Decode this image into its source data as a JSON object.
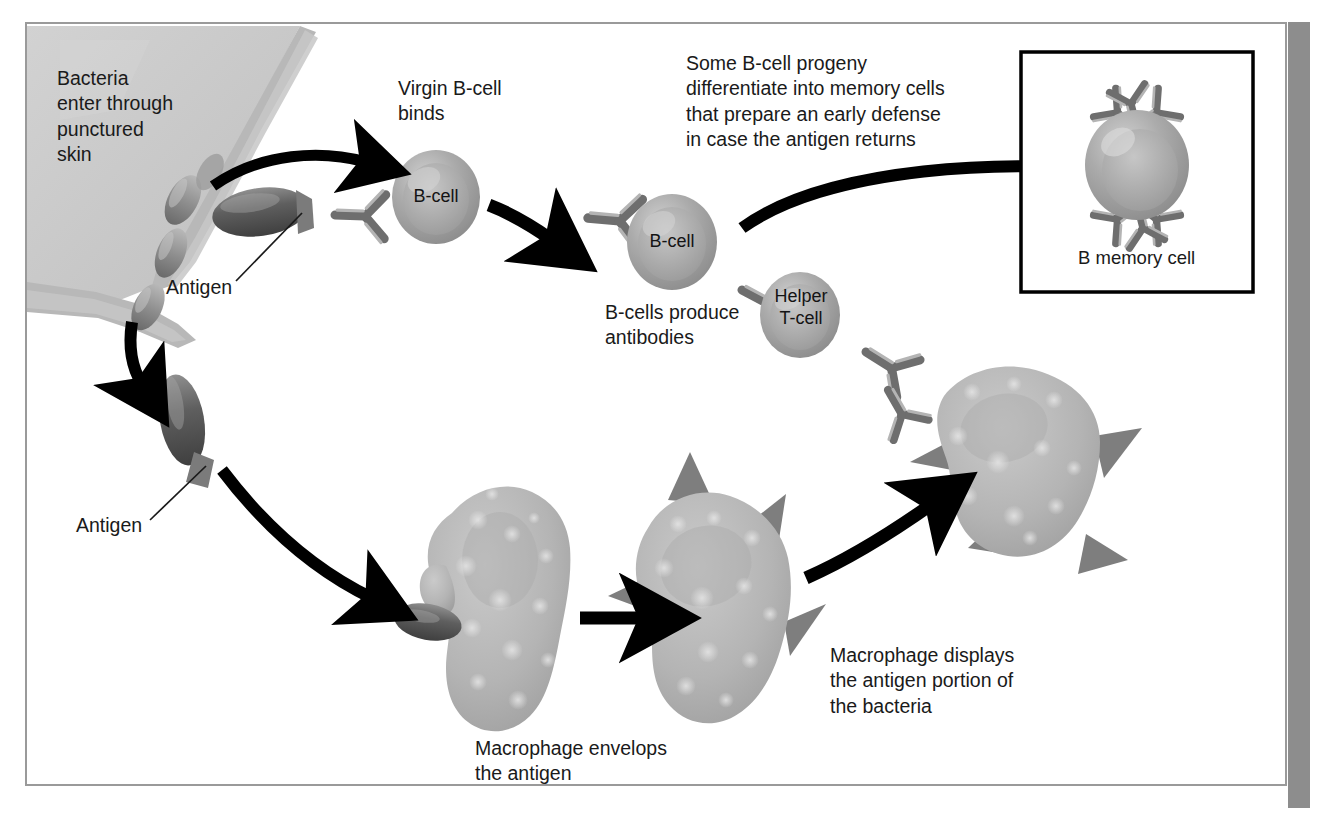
{
  "figure": {
    "domain": "Diagram",
    "title_visible": false,
    "frame": {
      "border_color": "#9a9a9a",
      "background": "#ffffff"
    },
    "page_edge_bar_color": "#8d8d8d"
  },
  "palette": {
    "skin_tissue": "#c9c9c9",
    "skin_tissue_strand": "#bdbdbd",
    "bacterium_dark": "#6b6b6b",
    "bacterium_light": "#a9a9a9",
    "cell_body": "#a3a3a3",
    "cell_highlight": "#c4c4c4",
    "antibody_dark": "#6e6e6e",
    "antibody_light": "#b4b4b4",
    "macrophage": "#b6b6b6",
    "macrophage_granule": "#d8d8d8",
    "antigen_spike": "#8a8a8a",
    "arrow": "#000000",
    "text": "#1a1a1a",
    "inset_border": "#000000"
  },
  "labels": {
    "bacteria_enter": "Bacteria\nenter through\npunctured\nskin",
    "antigen_top": "Antigen",
    "antigen_bottom": "Antigen",
    "virgin_bcell_binds": "Virgin B-cell\nbinds",
    "bcell_first": "B-cell",
    "bcell_second": "B-cell",
    "helper_tcell": "Helper\nT-cell",
    "bcells_produce_antibodies": "B-cells produce\nantibodies",
    "memory_text": "Some B-cell progeny\ndifferentiate into memory cells\nthat prepare an early defense\nin case the antigen returns",
    "b_memory_cell": "B memory cell",
    "macrophage_envelops": "Macrophage envelops\nthe antigen",
    "macrophage_displays": "Macrophage displays\nthe antigen portion of\nthe bacteria"
  },
  "flow_steps": [
    {
      "id": "step-1",
      "label": "Bacteria enter through punctured skin"
    },
    {
      "id": "step-2",
      "label": "Antigen on bacterium"
    },
    {
      "id": "step-3",
      "label": "Virgin B-cell binds"
    },
    {
      "id": "step-4",
      "label": "B-cells produce antibodies"
    },
    {
      "id": "step-5",
      "label": "Helper T-cell"
    },
    {
      "id": "step-6",
      "label": "Some B-cell progeny differentiate into memory cells"
    },
    {
      "id": "step-7",
      "label": "B memory cell"
    },
    {
      "id": "step-8",
      "label": "Macrophage envelops the antigen"
    },
    {
      "id": "step-9",
      "label": "Macrophage displays the antigen portion of the bacteria"
    }
  ],
  "cells": {
    "bcell_1": {
      "label": "B-cell",
      "antibodies": 1
    },
    "bcell_2": {
      "label": "B-cell",
      "antibodies": 2
    },
    "helper_tcell": {
      "label": "Helper T-cell",
      "antibodies": 2
    },
    "b_memory_cell": {
      "label": "B memory cell",
      "antibodies": 6
    }
  },
  "counts": {
    "free_bacteria_in_wound": 4,
    "macrophages": 3,
    "antigen_spikes_middle_macrophage": 4,
    "antigen_spikes_right_macrophage": 4,
    "arrows": 7
  }
}
